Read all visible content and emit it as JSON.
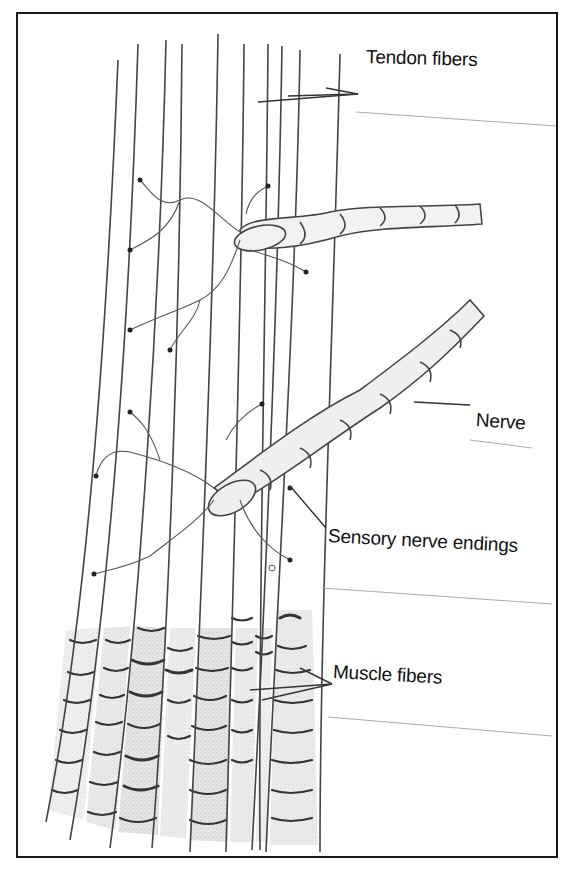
{
  "diagram": {
    "type": "anatomical-illustration",
    "labels": {
      "tendon_fibers": "Tendon fibers",
      "nerve": "Nerve",
      "sensory_nerve_endings": "Sensory nerve endings",
      "muscle_fibers": "Muscle fibers"
    },
    "colors": {
      "ink": "#1a1a1a",
      "line": "#555555",
      "muscle_shade": "#cfcfcf",
      "nerve_fill": "#ececec",
      "background": "#ffffff"
    }
  }
}
